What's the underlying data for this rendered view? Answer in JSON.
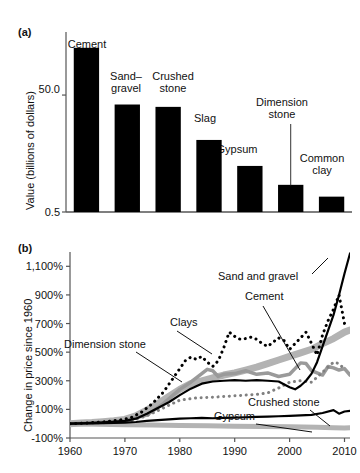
{
  "figure": {
    "panel_a_letter": "(a)",
    "panel_b_letter": "(b)"
  },
  "chart_data": [
    {
      "type": "bar",
      "panel": "(a)",
      "title": "",
      "xlabel": "",
      "ylabel": "Value (billions of dollars)",
      "ylim": [
        0.5,
        75
      ],
      "ytick_labels": [
        "50.0",
        "0.5"
      ],
      "yticks": [
        50.0,
        0.5
      ],
      "grid": false,
      "legend": "none",
      "categories": [
        "Cement",
        "Sand– gravel",
        "Crushed stone",
        "Slag",
        "Gypsum",
        "Dimension stone",
        "Common clay"
      ],
      "category_labels": [
        {
          "line1": "Cement",
          "line2": ""
        },
        {
          "line1": "Sand–",
          "line2": "gravel"
        },
        {
          "line1": "Crushed",
          "line2": "stone"
        },
        {
          "line1": "Slag",
          "line2": ""
        },
        {
          "line1": "Gypsum",
          "line2": ""
        },
        {
          "line1": "Dimension",
          "line2": "stone"
        },
        {
          "line1": "Common",
          "line2": "clay"
        }
      ],
      "values": [
        70.0,
        46.0,
        45.0,
        31.0,
        20.0,
        12.0,
        7.0
      ],
      "bar_color": "#000000"
    },
    {
      "type": "line",
      "panel": "(b)",
      "title": "",
      "xlabel": "",
      "ylabel": "Change in price since 1960",
      "xlim": [
        1960,
        2011
      ],
      "ylim": [
        -100,
        1200
      ],
      "xticks": [
        1960,
        1970,
        1980,
        1990,
        2000,
        2010
      ],
      "xtick_labels": [
        "1960",
        "1970",
        "1980",
        "1990",
        "2000",
        "2010"
      ],
      "yticks": [
        -100,
        100,
        300,
        500,
        700,
        900,
        1100
      ],
      "ytick_labels": [
        "-100%",
        "100%",
        "300%",
        "500%",
        "700%",
        "900%",
        "1,100%"
      ],
      "grid": false,
      "legend": "inline-annotations",
      "series": [
        {
          "name": "Sand and gravel",
          "style": "solid",
          "color": "#000000",
          "width": 2.2,
          "x": [
            1960,
            1962,
            1964,
            1966,
            1968,
            1970,
            1972,
            1974,
            1976,
            1978,
            1980,
            1982,
            1984,
            1986,
            1988,
            1990,
            1992,
            1994,
            1996,
            1998,
            2000,
            2001,
            2002,
            2003,
            2004,
            2005,
            2006,
            2007,
            2008,
            2009,
            2010,
            2011
          ],
          "y": [
            0,
            3,
            6,
            10,
            14,
            20,
            35,
            70,
            110,
            150,
            200,
            245,
            280,
            295,
            300,
            305,
            300,
            305,
            300,
            295,
            255,
            240,
            265,
            300,
            350,
            430,
            540,
            650,
            760,
            900,
            1050,
            1190
          ]
        },
        {
          "name": "Cement",
          "style": "solid",
          "color": "#b3b3b3",
          "width": 7,
          "x": [
            1960,
            1962,
            1964,
            1966,
            1968,
            1970,
            1972,
            1974,
            1976,
            1978,
            1980,
            1982,
            1984,
            1986,
            1988,
            1990,
            1992,
            1994,
            1996,
            1998,
            2000,
            2002,
            2004,
            2006,
            2008,
            2010,
            2011
          ],
          "y": [
            0,
            4,
            8,
            14,
            20,
            30,
            55,
            95,
            140,
            190,
            240,
            280,
            300,
            320,
            340,
            355,
            375,
            395,
            420,
            445,
            470,
            495,
            520,
            560,
            595,
            640,
            655
          ]
        },
        {
          "name": "Clays",
          "style": "dotted",
          "color": "#000000",
          "width": 3,
          "x": [
            1960,
            1963,
            1966,
            1969,
            1971,
            1973,
            1975,
            1977,
            1979,
            1981,
            1982,
            1983,
            1984,
            1985,
            1986,
            1987,
            1988,
            1989,
            1990,
            1991,
            1992,
            1993,
            1994,
            1995,
            1996,
            1997,
            1998,
            1999,
            2000,
            2001,
            2002,
            2003,
            2004,
            2005,
            2006,
            2007,
            2008,
            2009,
            2010
          ],
          "y": [
            0,
            5,
            12,
            25,
            40,
            80,
            140,
            220,
            330,
            440,
            465,
            450,
            470,
            430,
            400,
            440,
            530,
            640,
            610,
            590,
            595,
            605,
            590,
            560,
            540,
            570,
            600,
            580,
            520,
            560,
            600,
            640,
            560,
            480,
            620,
            720,
            800,
            900,
            700
          ]
        },
        {
          "name": "Dimension stone",
          "style": "dotted",
          "color": "#808080",
          "width": 3,
          "x": [
            1960,
            1964,
            1968,
            1971,
            1974,
            1977,
            1980,
            1983,
            1986,
            1988,
            1990,
            1992,
            1994,
            1996,
            1998,
            2000,
            2002,
            2004,
            2006,
            2008,
            2009,
            2010
          ],
          "y": [
            0,
            4,
            10,
            20,
            55,
            110,
            165,
            180,
            185,
            190,
            195,
            200,
            205,
            215,
            250,
            290,
            300,
            290,
            360,
            430,
            420,
            380
          ]
        },
        {
          "name": "Crushed stone",
          "style": "solid",
          "color": "#000000",
          "width": 2.2,
          "x": [
            1960,
            1964,
            1968,
            1970,
            1972,
            1974,
            1976,
            1978,
            1980,
            1982,
            1984,
            1986,
            1988,
            1990,
            1992,
            1994,
            1996,
            1998,
            2000,
            2002,
            2004,
            2006,
            2008,
            2009,
            2010,
            2011
          ],
          "y": [
            0,
            2,
            5,
            8,
            12,
            20,
            25,
            30,
            35,
            38,
            40,
            38,
            40,
            42,
            45,
            48,
            50,
            52,
            55,
            58,
            62,
            75,
            95,
            70,
            85,
            90
          ]
        },
        {
          "name": "Gypsum",
          "style": "solid",
          "color": "#b3b3b3",
          "width": 5,
          "x": [
            1960,
            1965,
            1970,
            1975,
            1980,
            1985,
            1990,
            1995,
            2000,
            2005,
            2008,
            2010,
            2011
          ],
          "y": [
            0,
            -4,
            -8,
            -10,
            -12,
            -15,
            -18,
            -20,
            -22,
            -25,
            -28,
            -30,
            -28
          ]
        },
        {
          "name": "mid-gray-series",
          "style": "solid",
          "color": "#9a9a9a",
          "width": 3.5,
          "x": [
            1960,
            1965,
            1970,
            1974,
            1977,
            1980,
            1982,
            1984,
            1985,
            1986,
            1987,
            1988,
            1990,
            1992,
            1994,
            1996,
            1998,
            2000,
            2002,
            2003,
            2004,
            2005,
            2006,
            2007,
            2008,
            2009,
            2010,
            2011
          ],
          "y": [
            0,
            8,
            22,
            60,
            140,
            240,
            290,
            350,
            380,
            370,
            330,
            345,
            350,
            370,
            345,
            355,
            330,
            345,
            425,
            420,
            370,
            355,
            340,
            400,
            390,
            375,
            385,
            340
          ]
        }
      ],
      "annotations": [
        {
          "text": "Sand and gravel",
          "x": 1997,
          "y": 1010
        },
        {
          "text": "Cement",
          "x": 2000,
          "y": 880
        },
        {
          "text": "Clays",
          "x": 1989,
          "y": 750
        },
        {
          "text": "Dimension stone",
          "x": 1969,
          "y": 655
        },
        {
          "text": "Crushed stone",
          "x": 1997,
          "y": 180
        },
        {
          "text": "Gypsum",
          "x": 1992,
          "y": 85
        }
      ]
    }
  ]
}
